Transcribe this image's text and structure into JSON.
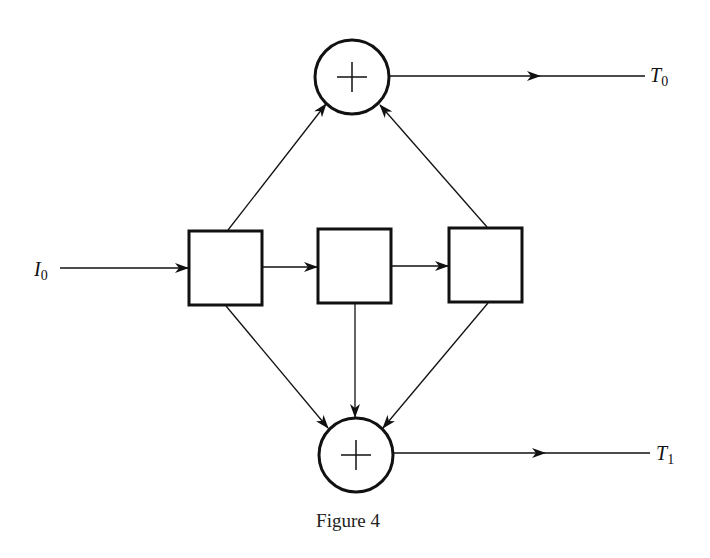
{
  "diagram": {
    "caption": "Figure 4",
    "input_label": {
      "main": "I",
      "sub": "0"
    },
    "outputs": [
      {
        "main": "T",
        "sub": "0"
      },
      {
        "main": "T",
        "sub": "1"
      }
    ],
    "nodes": [
      {
        "id": "sum-top",
        "type": "adder",
        "symbol": "+"
      },
      {
        "id": "box-1",
        "type": "block"
      },
      {
        "id": "box-2",
        "type": "block"
      },
      {
        "id": "box-3",
        "type": "block"
      },
      {
        "id": "sum-bottom",
        "type": "adder",
        "symbol": "+"
      }
    ],
    "edges": [
      [
        "I0",
        "box-1"
      ],
      [
        "box-1",
        "box-2"
      ],
      [
        "box-2",
        "box-3"
      ],
      [
        "box-1",
        "sum-top"
      ],
      [
        "box-3",
        "sum-top"
      ],
      [
        "box-1",
        "sum-bottom"
      ],
      [
        "box-2",
        "sum-bottom"
      ],
      [
        "box-3",
        "sum-bottom"
      ],
      [
        "sum-top",
        "T0"
      ],
      [
        "sum-bottom",
        "T1"
      ]
    ],
    "colors": {
      "stroke": "#111111",
      "background": "#ffffff"
    }
  }
}
